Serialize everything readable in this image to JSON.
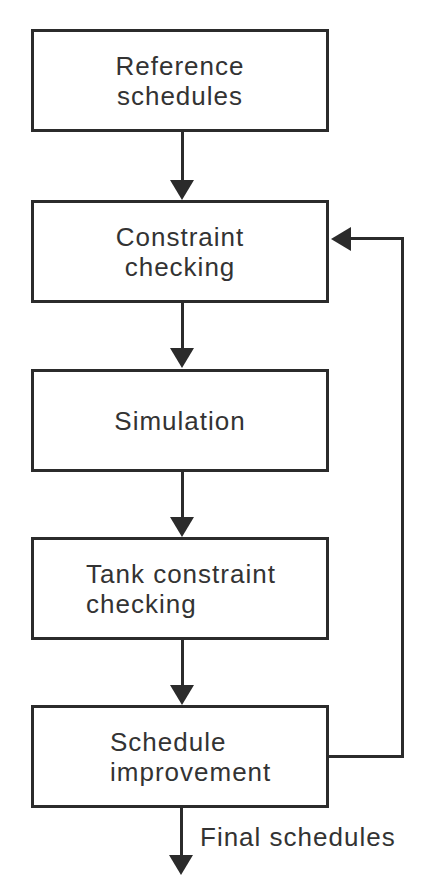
{
  "diagram": {
    "type": "flowchart",
    "nodes": [
      {
        "id": "reference",
        "line1": "Reference",
        "line2": "schedules"
      },
      {
        "id": "constraint",
        "line1": "Constraint",
        "line2": "checking"
      },
      {
        "id": "simulation",
        "line1": "Simulation",
        "line2": ""
      },
      {
        "id": "tank",
        "line1": "Tank constraint",
        "line2": "checking"
      },
      {
        "id": "improvement",
        "line1": "Schedule",
        "line2": "improvement"
      }
    ],
    "edges": [
      {
        "from": "reference",
        "to": "constraint"
      },
      {
        "from": "constraint",
        "to": "simulation"
      },
      {
        "from": "simulation",
        "to": "tank"
      },
      {
        "from": "tank",
        "to": "improvement"
      },
      {
        "from": "improvement",
        "to": "constraint",
        "kind": "feedback"
      },
      {
        "from": "improvement",
        "to": "output",
        "label": "Final schedules"
      }
    ],
    "output_label": "Final schedules",
    "colors": {
      "stroke": "#2b2b2b",
      "text": "#333333",
      "background": "#ffffff"
    }
  }
}
